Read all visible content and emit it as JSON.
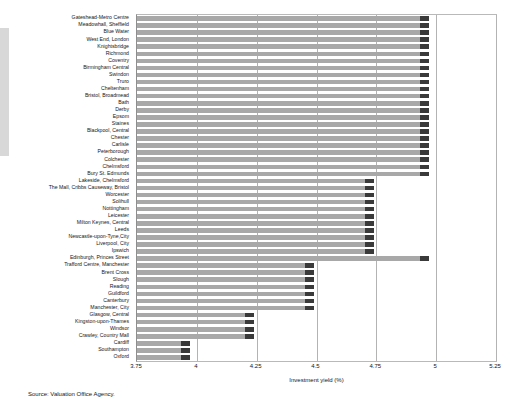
{
  "source_note": "Source: Valuation Office Agency.",
  "axis": {
    "xlabel": "Investment yield (%)",
    "ticks": [
      "3.75",
      "4",
      "4.25",
      "4.5",
      "4.75",
      "5",
      "5.25"
    ]
  },
  "colors": {
    "bar_fill": "#a8a8a8",
    "bar_cap": "#3a3a3a",
    "grid": "#b3b3b3",
    "frame": "#b9b9b9"
  },
  "chart_data": {
    "type": "bar",
    "orientation": "horizontal",
    "title": "",
    "xlabel": "Investment yield (%)",
    "ylabel": "",
    "xlim": [
      3.75,
      5.25
    ],
    "grid": true,
    "legend": null,
    "categories": [
      "Gateshead-Metro Centre",
      "Meadowhall, Sheffield",
      "Blue Water",
      "West End, London",
      "Knightsbridge",
      "Richmond",
      "Coventry",
      "Birmingham Central",
      "Swindon",
      "Truro",
      "Cheltenham",
      "Bristol, Broadmead",
      "Bath",
      "Derby",
      "Epsom",
      "Staines",
      "Blackpool, Central",
      "Chester",
      "Carlisle",
      "Peterborough",
      "Colchester",
      "Chelmsford",
      "Bury St. Edmunds",
      "Lakeside, Chelmsford",
      "The Mall, Cribbs Causeway, Bristol",
      "Worcester",
      "Solihull",
      "Nottingham",
      "Leicester",
      "Milton Keynes, Central",
      "Leeds",
      "Newcastle-upon-Tyne,City",
      "Liverpool, City",
      "Ipswich",
      "Edinburgh, Princes Street",
      "Trafford Centre, Manchester",
      "Brent Cross",
      "Slough",
      "Reading",
      "Guildford",
      "Canterbury",
      "Manchester, City",
      "Glasgow, Central",
      "Kingston-upon-Thames",
      "Windsor",
      "Crawley, Country Mall",
      "Cardiff",
      "Southampton",
      "Oxford"
    ],
    "values": [
      4.97,
      4.97,
      4.97,
      4.97,
      4.97,
      4.97,
      4.97,
      4.97,
      4.97,
      4.97,
      4.97,
      4.97,
      4.97,
      4.97,
      4.97,
      4.97,
      4.97,
      4.97,
      4.97,
      4.97,
      4.97,
      4.97,
      4.97,
      4.74,
      4.74,
      4.74,
      4.74,
      4.74,
      4.74,
      4.74,
      4.74,
      4.74,
      4.74,
      4.74,
      4.97,
      4.49,
      4.49,
      4.49,
      4.49,
      4.49,
      4.49,
      4.49,
      4.24,
      4.24,
      4.24,
      4.24,
      3.97,
      3.97,
      3.97
    ]
  }
}
